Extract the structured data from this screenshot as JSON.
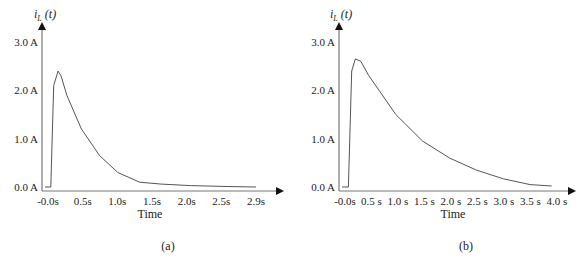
{
  "chart_data": [
    {
      "type": "line",
      "panel": "(a)",
      "ylabel": "i_L (t)",
      "xlabel": "Time",
      "yticks": [
        "0.0 A",
        "1.0 A",
        "2.0 A",
        "3.0 A"
      ],
      "xticks": [
        "-0.0s",
        "0.5s",
        "1.0s",
        "1.5s",
        "2.0s",
        "2.5s",
        "2.9s"
      ],
      "ylim": [
        0,
        3.0
      ],
      "xlim": [
        0,
        2.9
      ],
      "series": [
        {
          "name": "i_L(t)",
          "x": [
            0,
            0.08,
            0.12,
            0.18,
            0.22,
            0.3,
            0.5,
            0.75,
            1.0,
            1.3,
            1.6,
            2.0,
            2.5,
            2.9
          ],
          "values": [
            0,
            0,
            2.1,
            2.4,
            2.3,
            1.9,
            1.2,
            0.65,
            0.3,
            0.1,
            0.06,
            0.03,
            0.01,
            0.0
          ]
        }
      ]
    },
    {
      "type": "line",
      "panel": "(b)",
      "ylabel": "i_L (t)",
      "xlabel": "Time",
      "yticks": [
        "0.0 A",
        "1.0 A",
        "2.0 A",
        "3.0 A"
      ],
      "xticks": [
        "-0.0s",
        "0.5 s",
        "1.0 s",
        "1.5 s",
        "2.0 s",
        "2.5 s",
        "3.0 s",
        "3.5 s",
        "4.0 s"
      ],
      "ylim": [
        0,
        3.0
      ],
      "xlim": [
        0,
        4.0
      ],
      "series": [
        {
          "name": "i_L(t)",
          "x": [
            0,
            0.12,
            0.18,
            0.25,
            0.35,
            0.5,
            1.0,
            1.5,
            2.0,
            2.5,
            3.0,
            3.5,
            3.9
          ],
          "values": [
            0,
            0,
            2.4,
            2.65,
            2.6,
            2.3,
            1.5,
            0.95,
            0.6,
            0.35,
            0.17,
            0.05,
            0.02
          ]
        }
      ]
    }
  ],
  "captions": {
    "a": "(a)",
    "b": "(b)"
  }
}
